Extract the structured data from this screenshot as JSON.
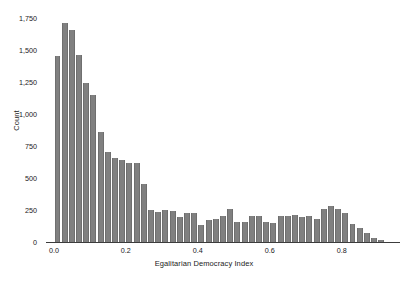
{
  "chart_data": {
    "type": "bar",
    "title": "",
    "subtitle": "",
    "xlabel": "Egalitarian Democracy Index",
    "ylabel": "Count",
    "xlim": [
      -0.022,
      0.962
    ],
    "ylim": [
      0,
      1750
    ],
    "grid": false,
    "legend": null,
    "bin_width": 0.02,
    "bar_color": "#808080",
    "axis_color": "#3c3c3c",
    "text_color": "#1a1a1a",
    "xticks": [
      {
        "value": 0.0,
        "label": "0.0"
      },
      {
        "value": 0.2,
        "label": "0.2"
      },
      {
        "value": 0.4,
        "label": "0.4"
      },
      {
        "value": 0.6,
        "label": "0.6"
      },
      {
        "value": 0.8,
        "label": "0.8"
      }
    ],
    "yticks": [
      {
        "value": 0,
        "label": "0"
      },
      {
        "value": 250,
        "label": "250"
      },
      {
        "value": 500,
        "label": "500"
      },
      {
        "value": 750,
        "label": "750"
      },
      {
        "value": 1000,
        "label": "1,000"
      },
      {
        "value": 1250,
        "label": "1,250"
      },
      {
        "value": 1500,
        "label": "1,500"
      },
      {
        "value": 1750,
        "label": "1,750"
      }
    ],
    "x": [
      0.0,
      0.02,
      0.04,
      0.06,
      0.08,
      0.1,
      0.12,
      0.14,
      0.16,
      0.18,
      0.2,
      0.22,
      0.24,
      0.26,
      0.28,
      0.3,
      0.32,
      0.34,
      0.36,
      0.38,
      0.4,
      0.42,
      0.44,
      0.46,
      0.48,
      0.5,
      0.52,
      0.54,
      0.56,
      0.58,
      0.6,
      0.62,
      0.64,
      0.66,
      0.68,
      0.7,
      0.72,
      0.74,
      0.76,
      0.78,
      0.8,
      0.82,
      0.84,
      0.86,
      0.88,
      0.9
    ],
    "values": [
      1450,
      1710,
      1660,
      1460,
      1240,
      1150,
      860,
      700,
      660,
      640,
      620,
      620,
      450,
      250,
      235,
      250,
      240,
      195,
      225,
      230,
      135,
      175,
      180,
      200,
      255,
      160,
      160,
      200,
      200,
      160,
      150,
      200,
      200,
      210,
      195,
      205,
      180,
      255,
      280,
      260,
      230,
      140,
      110,
      70,
      35,
      12
    ],
    "categories": [
      "0.00",
      "0.02",
      "0.04",
      "0.06",
      "0.08",
      "0.10",
      "0.12",
      "0.14",
      "0.16",
      "0.18",
      "0.20",
      "0.22",
      "0.24",
      "0.26",
      "0.28",
      "0.30",
      "0.32",
      "0.34",
      "0.36",
      "0.38",
      "0.40",
      "0.42",
      "0.44",
      "0.46",
      "0.48",
      "0.50",
      "0.52",
      "0.54",
      "0.56",
      "0.58",
      "0.60",
      "0.62",
      "0.64",
      "0.66",
      "0.68",
      "0.70",
      "0.72",
      "0.74",
      "0.76",
      "0.78",
      "0.80",
      "0.82",
      "0.84",
      "0.86",
      "0.88",
      "0.90"
    ]
  }
}
